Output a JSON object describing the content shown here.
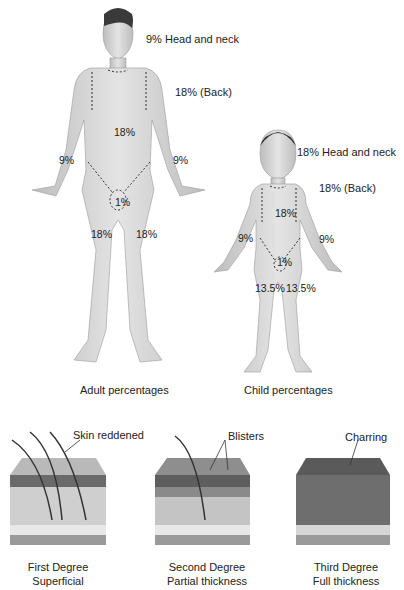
{
  "diagram": {
    "adult": {
      "caption": "Adult percentages",
      "labels": {
        "head_neck": "9% Head and neck",
        "back": "18% (Back)",
        "trunk_front": "18%",
        "arm_left": "9%",
        "arm_right": "9%",
        "genitals": "1%",
        "leg_left": "18%",
        "leg_right": "18%"
      }
    },
    "child": {
      "caption": "Child percentages",
      "labels": {
        "head_neck": "18% Head and neck",
        "back": "18% (Back)",
        "trunk_front": "18%",
        "arm_left": "9%",
        "arm_right": "9%",
        "genitals": "1%",
        "leg_left": "13.5%",
        "leg_right": "13.5%"
      }
    },
    "burn_degrees": [
      {
        "annotation": "Skin reddened",
        "line1": "First Degree",
        "line2": "Superficial"
      },
      {
        "annotation": "Blisters",
        "line1": "Second Degree",
        "line2": "Partial thickness"
      },
      {
        "annotation": "Charring",
        "line1": "Third Degree",
        "line2": "Full thickness"
      }
    ],
    "colors": {
      "skin": "#d8d8d8",
      "skin_shade": "#b5b5b5",
      "hair": "#3a3a3a",
      "dash": "#333333",
      "text": "#222222"
    }
  }
}
